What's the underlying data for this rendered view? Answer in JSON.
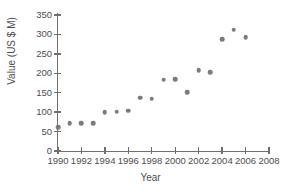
{
  "chart_data": {
    "type": "scatter",
    "title": "",
    "xlabel": "Year",
    "ylabel": "Value (US $ M)",
    "xlim": [
      1990,
      2008
    ],
    "ylim": [
      0,
      350
    ],
    "xticks": [
      1990,
      1992,
      1994,
      1996,
      1998,
      2000,
      2002,
      2004,
      2006,
      2008
    ],
    "yticks": [
      0,
      50,
      100,
      150,
      200,
      250,
      300,
      350
    ],
    "xtick_step": 2,
    "ytick_step": 50,
    "grid": false,
    "legend": "none",
    "marker": "circle",
    "marker_color": "#7b7b7b",
    "x": [
      1990,
      1991,
      1992,
      1993,
      1994,
      1995,
      1996,
      1997,
      1998,
      1999,
      2000,
      2001,
      2002,
      2003,
      2004,
      2005,
      2006
    ],
    "values": [
      62,
      72,
      71,
      72,
      100,
      101,
      104,
      137,
      135,
      183,
      185,
      152,
      208,
      203,
      287,
      312,
      293
    ],
    "points": [
      {
        "x": 1990,
        "y": 62
      },
      {
        "x": 1991,
        "y": 72
      },
      {
        "x": 1992,
        "y": 71
      },
      {
        "x": 1993,
        "y": 72
      },
      {
        "x": 1994,
        "y": 100
      },
      {
        "x": 1995,
        "y": 101
      },
      {
        "x": 1996,
        "y": 104
      },
      {
        "x": 1997,
        "y": 137
      },
      {
        "x": 1998,
        "y": 135
      },
      {
        "x": 1999,
        "y": 183
      },
      {
        "x": 2000,
        "y": 185
      },
      {
        "x": 2001,
        "y": 152
      },
      {
        "x": 2002,
        "y": 208
      },
      {
        "x": 2003,
        "y": 203
      },
      {
        "x": 2004,
        "y": 287
      },
      {
        "x": 2005,
        "y": 312
      },
      {
        "x": 2006,
        "y": 293
      }
    ]
  },
  "axis_color": "#6f6f6f",
  "text_color": "#4d4d4d"
}
